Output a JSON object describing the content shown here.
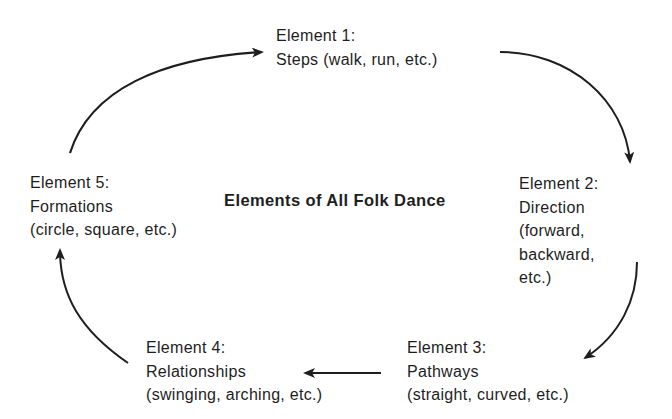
{
  "diagram": {
    "title": "Elements of All Folk Dance",
    "nodes": [
      {
        "id": "element-1",
        "heading": "Element 1:",
        "lines": [
          "Steps (walk, run, etc.)"
        ]
      },
      {
        "id": "element-2",
        "heading": "Element 2:",
        "lines": [
          "Direction",
          "(forward,",
          "backward,",
          "etc.)"
        ]
      },
      {
        "id": "element-3",
        "heading": "Element 3:",
        "lines": [
          "Pathways",
          "(straight, curved, etc.)"
        ]
      },
      {
        "id": "element-4",
        "heading": "Element 4:",
        "lines": [
          "Relationships",
          "(swinging, arching, etc.)"
        ]
      },
      {
        "id": "element-5",
        "heading": "Element 5:",
        "lines": [
          "Formations",
          "(circle, square, etc.)"
        ]
      }
    ],
    "edges": [
      {
        "from": "element-1",
        "to": "element-2",
        "shape": "curved"
      },
      {
        "from": "element-2",
        "to": "element-3",
        "shape": "curved"
      },
      {
        "from": "element-3",
        "to": "element-4",
        "shape": "straight"
      },
      {
        "from": "element-4",
        "to": "element-5",
        "shape": "curved"
      },
      {
        "from": "element-5",
        "to": "element-1",
        "shape": "curved"
      }
    ],
    "colors": {
      "stroke": "#1e1e1e",
      "text": "#1e1e1e",
      "background": "#ffffff"
    }
  }
}
